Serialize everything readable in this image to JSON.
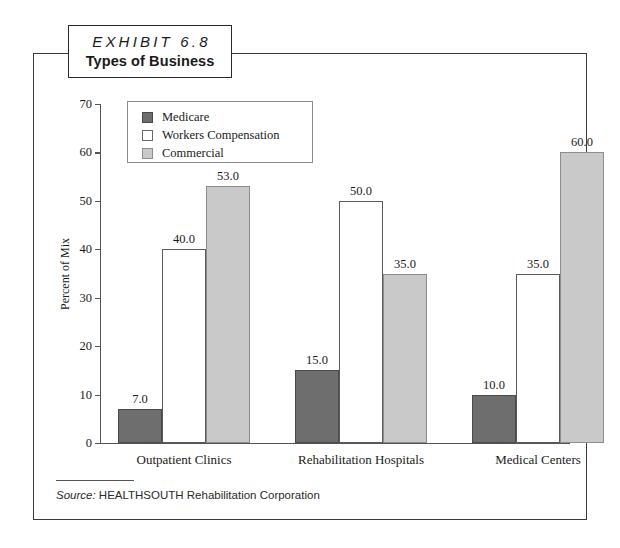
{
  "exhibit": {
    "label": "EXHIBIT 6.8",
    "title": "Types of Business"
  },
  "source": {
    "prefix": "Source:",
    "text": "HEALTHSOUTH Rehabilitation Corporation"
  },
  "colors": {
    "medicare": "#6e6e6e",
    "workers": "#ffffff",
    "commercial": "#c9c9c9",
    "axis": "#555555",
    "frame": "#3a3a3a"
  },
  "chart_data": {
    "type": "bar",
    "title": "Types of Business",
    "xlabel": "",
    "ylabel": "Percent of Mix",
    "ylim": [
      0,
      70
    ],
    "yticks": [
      0,
      10,
      20,
      30,
      40,
      50,
      60,
      70
    ],
    "ytick_labels": [
      "0",
      "10",
      "20",
      "30",
      "40",
      "50",
      "60",
      "70"
    ],
    "grid": false,
    "legend_position": "upper-left-inside",
    "categories": [
      "Outpatient Clinics",
      "Rehabilitation Hospitals",
      "Medical Centers"
    ],
    "series": [
      {
        "name": "Medicare",
        "values": [
          7.0,
          15.0,
          10.0
        ],
        "labels": [
          "7.0",
          "15.0",
          "10.0"
        ]
      },
      {
        "name": "Workers Compensation",
        "values": [
          40.0,
          50.0,
          35.0
        ],
        "labels": [
          "40.0",
          "50.0",
          "35.0"
        ]
      },
      {
        "name": "Commercial",
        "values": [
          53.0,
          35.0,
          60.0
        ],
        "labels": [
          "53.0",
          "35.0",
          "60.0"
        ]
      }
    ]
  }
}
